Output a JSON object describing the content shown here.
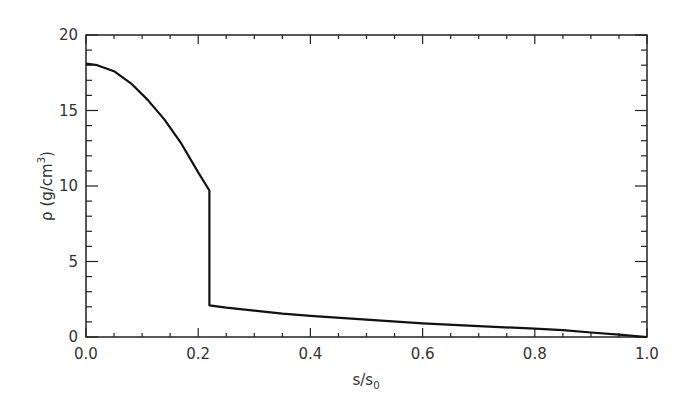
{
  "chart_data": {
    "type": "line",
    "title": "",
    "xlabel": "s/s₀",
    "ylabel": "ρ (g/cm³)",
    "xlim": [
      0.0,
      1.0
    ],
    "ylim": [
      0,
      20
    ],
    "x_ticks": [
      "0.0",
      "0.2",
      "0.4",
      "0.6",
      "0.8",
      "1.0"
    ],
    "y_ticks": [
      "0",
      "5",
      "10",
      "15",
      "20"
    ],
    "grid": false,
    "legend": null,
    "series": [
      {
        "name": "density",
        "x": [
          0.0,
          0.02,
          0.05,
          0.08,
          0.11,
          0.14,
          0.17,
          0.2,
          0.22,
          0.22,
          0.25,
          0.3,
          0.35,
          0.4,
          0.5,
          0.6,
          0.7,
          0.8,
          0.85,
          0.9,
          0.95,
          1.0
        ],
        "y": [
          18.1,
          18.0,
          17.6,
          16.8,
          15.7,
          14.4,
          12.8,
          10.9,
          9.7,
          2.1,
          1.95,
          1.75,
          1.55,
          1.4,
          1.15,
          0.9,
          0.72,
          0.55,
          0.45,
          0.3,
          0.15,
          0.0
        ]
      }
    ],
    "annotations": []
  },
  "axes": {
    "x_label_main": "s/s",
    "x_label_sub": "0",
    "y_label_main": "ρ (g/cm",
    "y_label_sup": "3",
    "y_label_close": ")"
  }
}
